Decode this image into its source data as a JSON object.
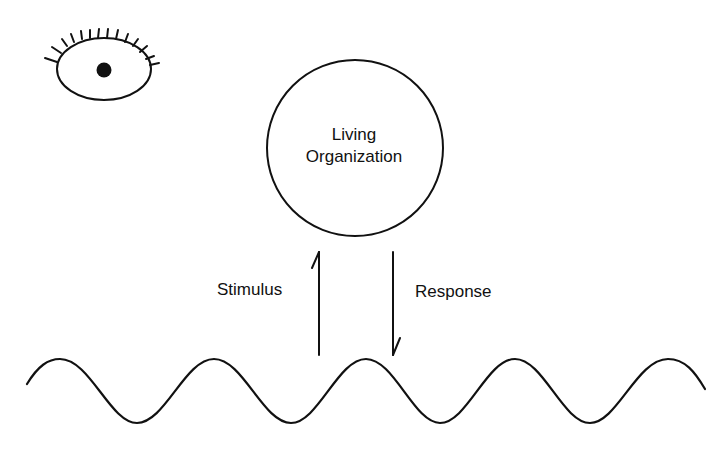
{
  "diagram": {
    "organism": {
      "line1": "Living",
      "line2": "Organization"
    },
    "stimulus_label": "Stimulus",
    "response_label": "Response",
    "icons": {
      "observer": "eye-icon",
      "environment": "wave"
    },
    "colors": {
      "stroke": "#111111",
      "background": "#ffffff"
    }
  }
}
